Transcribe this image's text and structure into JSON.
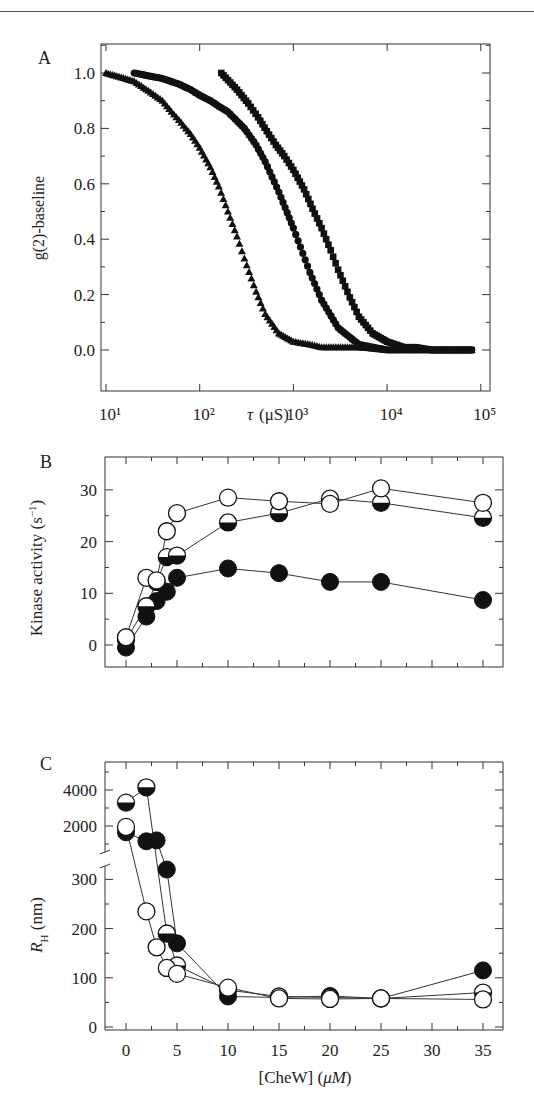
{
  "figure": {
    "panels": [
      "A",
      "B",
      "C"
    ]
  },
  "chart_data": [
    {
      "panel": "A",
      "type": "scatter",
      "title": "",
      "xlabel": "τ (μS)",
      "ylabel": "g(2)-baseline",
      "xscale": "log",
      "xlim": [
        5,
        100000
      ],
      "ylim": [
        -0.1,
        1.1
      ],
      "xticks": [
        "10¹",
        "10²",
        "10³",
        "10⁴",
        "10⁵"
      ],
      "yticks": [
        "0.0",
        "0.2",
        "0.4",
        "0.6",
        "0.8",
        "1.0"
      ],
      "grid": false,
      "legend": null,
      "series": [
        {
          "name": "triangles",
          "marker": "triangle",
          "x": [
            10,
            20,
            30,
            40,
            50,
            60,
            80,
            100,
            130,
            160,
            200,
            250,
            300,
            400,
            500,
            700,
            1000,
            1500,
            2000,
            3000,
            5000,
            10000,
            30000,
            80000
          ],
          "y": [
            1.0,
            0.97,
            0.93,
            0.9,
            0.86,
            0.83,
            0.78,
            0.73,
            0.66,
            0.59,
            0.5,
            0.41,
            0.33,
            0.21,
            0.13,
            0.06,
            0.03,
            0.02,
            0.01,
            0.01,
            0.01,
            0.0,
            0.0,
            0.0
          ]
        },
        {
          "name": "circles",
          "marker": "circle",
          "x": [
            20,
            40,
            60,
            80,
            100,
            130,
            160,
            200,
            300,
            400,
            500,
            700,
            1000,
            1500,
            2000,
            3000,
            5000,
            10000,
            30000,
            80000
          ],
          "y": [
            1.0,
            0.98,
            0.96,
            0.94,
            0.92,
            0.9,
            0.88,
            0.86,
            0.8,
            0.74,
            0.68,
            0.57,
            0.44,
            0.28,
            0.18,
            0.08,
            0.02,
            0.0,
            0.0,
            0.0
          ]
        },
        {
          "name": "squares",
          "marker": "square",
          "x": [
            170,
            250,
            330,
            420,
            520,
            650,
            800,
            1000,
            1300,
            1600,
            2000,
            2500,
            3000,
            4000,
            5000,
            7000,
            10000,
            15000,
            20000,
            30000,
            50000,
            80000
          ],
          "y": [
            1.0,
            0.94,
            0.89,
            0.84,
            0.79,
            0.74,
            0.7,
            0.65,
            0.58,
            0.51,
            0.44,
            0.36,
            0.29,
            0.19,
            0.12,
            0.06,
            0.03,
            0.01,
            0.01,
            0.0,
            0.0,
            0.0
          ]
        }
      ]
    },
    {
      "panel": "B",
      "type": "line",
      "title": "",
      "xlabel": "",
      "ylabel": "Kinase activity (s⁻¹)",
      "xlim": [
        -2,
        38
      ],
      "ylim": [
        -2,
        33
      ],
      "xticks": [
        "0",
        "5",
        "10",
        "15",
        "20",
        "25",
        "30",
        "35"
      ],
      "yticks": [
        "0",
        "10",
        "20",
        "30"
      ],
      "grid": false,
      "legend": null,
      "series": [
        {
          "name": "open circles",
          "marker": "open-circle",
          "x": [
            0,
            2,
            3,
            4,
            5,
            10,
            15,
            20,
            25,
            35
          ],
          "y": [
            1.5,
            13.0,
            12.5,
            22.0,
            25.5,
            28.5,
            27.8,
            27.3,
            30.3,
            27.5
          ]
        },
        {
          "name": "half-filled circles",
          "marker": "half-filled-circle",
          "x": [
            0,
            2,
            3,
            4,
            5,
            10,
            15,
            20,
            25,
            35
          ],
          "y": [
            1.0,
            7.5,
            12.2,
            17.0,
            17.3,
            23.7,
            25.5,
            28.3,
            27.5,
            24.6
          ]
        },
        {
          "name": "filled circles",
          "marker": "filled-circle",
          "x": [
            0,
            2,
            3,
            4,
            5,
            10,
            15,
            20,
            25,
            35
          ],
          "y": [
            -0.5,
            5.5,
            8.5,
            10.3,
            13.0,
            14.8,
            13.9,
            12.2,
            12.2,
            8.7
          ]
        }
      ]
    },
    {
      "panel": "C",
      "type": "line",
      "title": "",
      "xlabel": "[CheW] (μM)",
      "ylabel": "R_H (nm)",
      "xlim": [
        -2,
        38
      ],
      "ylim": [
        0,
        4800
      ],
      "axis_break": "between 300 and 2000",
      "xticks": [
        "0",
        "5",
        "10",
        "15",
        "20",
        "25",
        "30",
        "35"
      ],
      "yticks": [
        "0",
        "100",
        "200",
        "300",
        "2000",
        "4000"
      ],
      "grid": false,
      "legend": null,
      "series": [
        {
          "name": "open circles",
          "marker": "open-circle",
          "x": [
            0,
            2,
            3,
            4,
            5,
            10,
            15,
            20,
            25,
            35
          ],
          "y": [
            1950,
            235,
            162,
            120,
            108,
            80,
            58,
            57,
            58,
            56
          ]
        },
        {
          "name": "half-filled circles",
          "marker": "half-filled-circle",
          "x": [
            0,
            2,
            4,
            5,
            10,
            15,
            20,
            25,
            35
          ],
          "y": [
            3300,
            4150,
            190,
            125,
            75,
            62,
            60,
            58,
            70
          ]
        },
        {
          "name": "filled circles",
          "marker": "filled-circle",
          "x": [
            0,
            2,
            3,
            4,
            5,
            10,
            15,
            20,
            25,
            35
          ],
          "y": [
            1650,
            1150,
            1200,
            320,
            170,
            62,
            60,
            63,
            58,
            115
          ]
        }
      ]
    }
  ],
  "labels": {
    "panelA": "A",
    "panelB": "B",
    "panelC": "C",
    "a_ylabel": "g(2)-baseline",
    "a_xlabel_tau": "τ",
    "a_xlabel_unit": "(μS)",
    "b_ylabel": "Kinase activity (s",
    "b_ylabel_sup": "−1",
    "b_ylabel_end": ")",
    "c_ylabel_R": "R",
    "c_ylabel_sub": "H",
    "c_ylabel_unit": " (nm)",
    "c_xlabel": "[CheW] (",
    "c_xlabel_unit": "μM",
    "c_xlabel_end": ")"
  }
}
